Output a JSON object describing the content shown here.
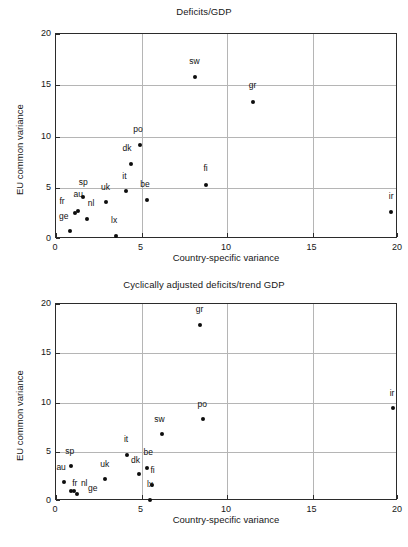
{
  "figure": {
    "axis_x_label": "Country-specific variance",
    "axis_y_label": "EU common variance"
  },
  "chart_data": [
    {
      "type": "scatter",
      "title": "Deficits/GDP",
      "xlabel": "Country-specific variance",
      "ylabel": "EU common variance",
      "xlim": [
        0,
        20
      ],
      "ylim": [
        0,
        20
      ],
      "xticks": [
        0,
        5,
        10,
        15,
        20
      ],
      "yticks": [
        0,
        5,
        10,
        15,
        20
      ],
      "xtick_labels": [
        "0",
        "5",
        "10",
        "15",
        "20"
      ],
      "ytick_labels": [
        "0",
        "5",
        "10",
        "15",
        "20"
      ],
      "grid": true,
      "legend": "none",
      "points": [
        {
          "label": "ge",
          "x": 0.8,
          "y": 0.8,
          "lx": -0.35,
          "ly": 0.95
        },
        {
          "label": "fr",
          "x": 1.1,
          "y": 2.5,
          "lx": -0.75,
          "ly": 0.75
        },
        {
          "label": "au",
          "x": 1.3,
          "y": 2.7,
          "lx": 0.0,
          "ly": 1.25
        },
        {
          "label": "nl",
          "x": 1.8,
          "y": 2.0,
          "lx": 0.25,
          "ly": 1.05
        },
        {
          "label": "sp",
          "x": 1.6,
          "y": 4.1,
          "lx": 0.0,
          "ly": 0.95
        },
        {
          "label": "uk",
          "x": 2.9,
          "y": 3.6,
          "lx": 0.0,
          "ly": 1.0
        },
        {
          "label": "lx",
          "x": 3.5,
          "y": 0.3,
          "lx": -0.1,
          "ly": 1.05
        },
        {
          "label": "it",
          "x": 4.1,
          "y": 4.7,
          "lx": -0.1,
          "ly": 1.0
        },
        {
          "label": "dk",
          "x": 4.4,
          "y": 7.3,
          "lx": -0.25,
          "ly": 1.05
        },
        {
          "label": "po",
          "x": 4.9,
          "y": 9.2,
          "lx": -0.1,
          "ly": 1.05
        },
        {
          "label": "be",
          "x": 5.3,
          "y": 3.8,
          "lx": -0.1,
          "ly": 1.1
        },
        {
          "label": "sw",
          "x": 8.1,
          "y": 15.8,
          "lx": 0.0,
          "ly": 1.1
        },
        {
          "label": "fi",
          "x": 8.8,
          "y": 5.3,
          "lx": -0.05,
          "ly": 1.1
        },
        {
          "label": "gr",
          "x": 11.5,
          "y": 13.4,
          "lx": 0.0,
          "ly": 1.1
        },
        {
          "label": "ir",
          "x": 19.6,
          "y": 2.6,
          "lx": 0.0,
          "ly": 1.1
        }
      ]
    },
    {
      "type": "scatter",
      "title": "Cyclically adjusted deficits/trend GDP",
      "xlabel": "Country-specific variance",
      "ylabel": "EU common variance",
      "xlim": [
        0,
        20
      ],
      "ylim": [
        0,
        20
      ],
      "xticks": [
        0,
        5,
        10,
        15,
        20
      ],
      "yticks": [
        0,
        5,
        10,
        15,
        20
      ],
      "xtick_labels": [
        "0",
        "5",
        "10",
        "15",
        "20"
      ],
      "ytick_labels": [
        "0",
        "5",
        "10",
        "15",
        "20"
      ],
      "grid": true,
      "legend": "none",
      "points": [
        {
          "label": "au",
          "x": 0.45,
          "y": 1.9,
          "lx": -0.15,
          "ly": 1.0
        },
        {
          "label": "fr",
          "x": 0.85,
          "y": 1.0,
          "lx": 0.25,
          "ly": 0.3
        },
        {
          "label": "nl",
          "x": 1.05,
          "y": 1.0,
          "lx": 0.6,
          "ly": 0.3
        },
        {
          "label": "ge",
          "x": 1.25,
          "y": 0.75,
          "lx": 0.9,
          "ly": 0.05
        },
        {
          "label": "sp",
          "x": 0.85,
          "y": 3.6,
          "lx": -0.05,
          "ly": 1.0
        },
        {
          "label": "uk",
          "x": 2.85,
          "y": 2.2,
          "lx": 0.0,
          "ly": 1.05
        },
        {
          "label": "it",
          "x": 4.15,
          "y": 4.7,
          "lx": -0.05,
          "ly": 1.05
        },
        {
          "label": "dk",
          "x": 4.85,
          "y": 2.7,
          "lx": -0.2,
          "ly": 1.0
        },
        {
          "label": "be",
          "x": 5.35,
          "y": 3.4,
          "lx": 0.05,
          "ly": 1.05
        },
        {
          "label": "fi",
          "x": 5.6,
          "y": 1.6,
          "lx": 0.05,
          "ly": 1.05
        },
        {
          "label": "lx",
          "x": 5.5,
          "y": 0.1,
          "lx": 0.0,
          "ly": 1.1
        },
        {
          "label": "sw",
          "x": 6.2,
          "y": 6.8,
          "lx": -0.15,
          "ly": 1.05
        },
        {
          "label": "po",
          "x": 8.6,
          "y": 8.3,
          "lx": -0.05,
          "ly": 1.05
        },
        {
          "label": "gr",
          "x": 8.4,
          "y": 17.9,
          "lx": 0.0,
          "ly": 1.05
        },
        {
          "label": "ir",
          "x": 19.7,
          "y": 9.4,
          "lx": -0.05,
          "ly": 1.05
        }
      ]
    }
  ]
}
